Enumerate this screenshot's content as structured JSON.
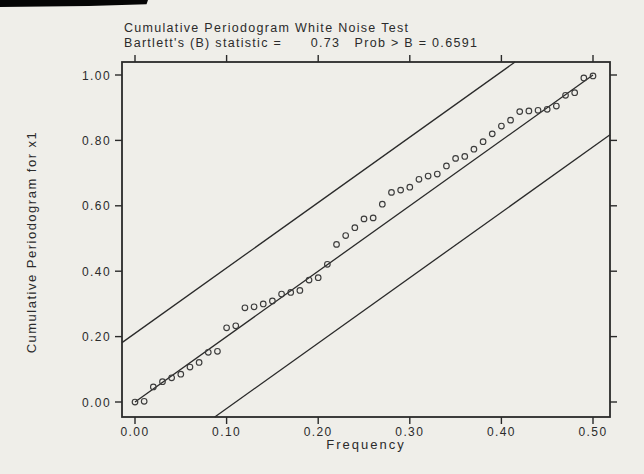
{
  "figure": {
    "title_line1": "Cumulative Periodogram White Noise Test",
    "title_line2": "Bartlett's (B) statistic =      0.73   Prob > B = 0.6591",
    "x_axis_label": "Frequency",
    "y_axis_label": "Cumulative Periodogram for x1"
  },
  "colors": {
    "background": "#efeee9",
    "ink": "#2a2a2a",
    "marker_stroke": "#3c3c3c",
    "scan_artifact": "#050505"
  },
  "chart_data": {
    "type": "scatter",
    "title": "Cumulative Periodogram White Noise Test",
    "subtitle": "Bartlett's (B) statistic = 0.73  Prob > B = 0.6591",
    "statistics": {
      "bartlett_b": 0.73,
      "prob_gt_b": 0.6591
    },
    "xlabel": "Frequency",
    "ylabel": "Cumulative Periodogram for x1",
    "xlim": [
      0,
      0.5
    ],
    "ylim": [
      0,
      1
    ],
    "grid": false,
    "legend": null,
    "marker": "open-circle",
    "x_ticks": [
      0.0,
      0.1,
      0.2,
      0.3,
      0.4,
      0.5
    ],
    "x_tick_labels": [
      "0.00",
      "0.10",
      "0.20",
      "0.30",
      "0.40",
      "0.50"
    ],
    "y_ticks": [
      0.0,
      0.2,
      0.4,
      0.6,
      0.8,
      1.0
    ],
    "y_tick_labels": [
      "0.00",
      "0.20",
      "0.40",
      "0.60",
      "0.80",
      "1.00"
    ],
    "x": [
      0.0,
      0.01,
      0.02,
      0.03,
      0.04,
      0.05,
      0.06,
      0.07,
      0.08,
      0.09,
      0.1,
      0.11,
      0.12,
      0.13,
      0.14,
      0.15,
      0.16,
      0.17,
      0.18,
      0.19,
      0.2,
      0.21,
      0.22,
      0.23,
      0.24,
      0.25,
      0.26,
      0.27,
      0.28,
      0.29,
      0.3,
      0.31,
      0.32,
      0.33,
      0.34,
      0.35,
      0.36,
      0.37,
      0.38,
      0.39,
      0.4,
      0.41,
      0.42,
      0.43,
      0.44,
      0.45,
      0.46,
      0.47,
      0.48,
      0.49,
      0.5
    ],
    "y": [
      0.0,
      0.002,
      0.046,
      0.062,
      0.074,
      0.085,
      0.107,
      0.121,
      0.152,
      0.155,
      0.227,
      0.233,
      0.288,
      0.291,
      0.3,
      0.309,
      0.33,
      0.335,
      0.341,
      0.373,
      0.38,
      0.421,
      0.482,
      0.509,
      0.533,
      0.56,
      0.563,
      0.605,
      0.641,
      0.648,
      0.657,
      0.681,
      0.691,
      0.697,
      0.722,
      0.745,
      0.751,
      0.773,
      0.796,
      0.82,
      0.844,
      0.862,
      0.888,
      0.89,
      0.892,
      0.895,
      0.905,
      0.938,
      0.946,
      0.991,
      0.997
    ],
    "reference_lines": [
      {
        "name": "diagonal-reference-line",
        "slope": 2,
        "intercept": 0.0,
        "span": "data"
      },
      {
        "name": "upper-confidence-band",
        "slope": 2,
        "intercept": 0.21,
        "span": "frame"
      },
      {
        "name": "lower-confidence-band",
        "slope": 2,
        "intercept": -0.22,
        "span": "frame"
      }
    ]
  }
}
